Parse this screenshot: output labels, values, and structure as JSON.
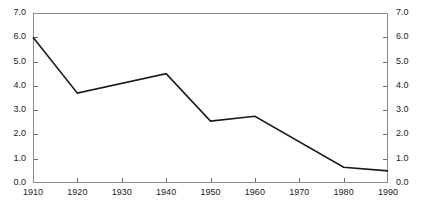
{
  "chart_data": {
    "type": "line",
    "title": "",
    "subtitle": "",
    "xlabel": "",
    "ylabel": "",
    "x": [
      1910,
      1920,
      1940,
      1950,
      1960,
      1980,
      1990
    ],
    "values": [
      6.0,
      3.7,
      4.5,
      2.55,
      2.75,
      0.65,
      0.5
    ],
    "series": [
      {
        "name": "",
        "x": [
          1910,
          1920,
          1940,
          1950,
          1960,
          1980,
          1990
        ],
        "values": [
          6.0,
          3.7,
          4.5,
          2.55,
          2.75,
          0.65,
          0.5
        ]
      }
    ],
    "xlim": [
      1910,
      1990
    ],
    "ylim": [
      0.0,
      7.0
    ],
    "xticks": [
      1910,
      1920,
      1930,
      1940,
      1950,
      1960,
      1970,
      1980,
      1990
    ],
    "yticks": [
      0.0,
      1.0,
      2.0,
      3.0,
      4.0,
      5.0,
      6.0,
      7.0
    ],
    "xticklabels": [
      "1910",
      "1920",
      "1930",
      "1940",
      "1950",
      "1960",
      "1970",
      "1980",
      "1990"
    ],
    "yticklabels": [
      "0.0",
      "1.0",
      "2.0",
      "3.0",
      "4.0",
      "5.0",
      "6.0",
      "7.0"
    ],
    "y_axis_right_labels": [
      "0.0",
      "1.0",
      "2.0",
      "3.0",
      "4.0",
      "5.0",
      "6.0",
      "7.0"
    ],
    "grid": false,
    "legend": null,
    "annotations": [],
    "line_color": "#1a1a1a",
    "axis_color": "#8a8a8a",
    "text_color": "#222222",
    "background": "#ffffff"
  }
}
